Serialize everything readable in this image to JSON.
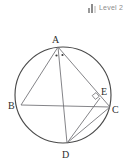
{
  "badge": {
    "label": "Level 2",
    "bars": [
      {
        "name": "bar-1",
        "height": 5,
        "color": "#9a9a9a"
      },
      {
        "name": "bar-2",
        "height": 9,
        "color": "#8c8c8c"
      },
      {
        "name": "bar-3",
        "height": 7,
        "color": "#d8d8d8"
      }
    ]
  },
  "figure": {
    "type": "circle-geometry-diagram",
    "background": "#ffffff",
    "stroke_circle": "#4a4a4a",
    "stroke_chord": "#6e6e72",
    "circle": {
      "cx": 63,
      "cy": 95,
      "r": 48
    },
    "points": {
      "A": {
        "label": "A",
        "x": 58,
        "y": 47,
        "label_x": 52,
        "label_y": 43
      },
      "B": {
        "label": "B",
        "x": 21,
        "y": 105,
        "label_x": 8,
        "label_y": 109
      },
      "C": {
        "label": "C",
        "x": 110,
        "y": 107,
        "label_x": 112,
        "label_y": 113
      },
      "D": {
        "label": "D",
        "x": 67,
        "y": 143,
        "label_x": 62,
        "label_y": 158
      },
      "E": {
        "label": "E",
        "x": 100,
        "y": 98,
        "label_x": 101,
        "label_y": 95
      }
    },
    "chords": [
      {
        "name": "chord-ab",
        "from": "A",
        "to": "B"
      },
      {
        "name": "chord-ad",
        "from": "A",
        "to": "D"
      },
      {
        "name": "chord-ac",
        "from": "A",
        "to": "C"
      },
      {
        "name": "chord-bc",
        "from": "B",
        "to": "C"
      },
      {
        "name": "chord-dc",
        "from": "D",
        "to": "C"
      },
      {
        "name": "chord-de",
        "from": "D",
        "to": "E"
      }
    ],
    "angle_marks": [
      {
        "name": "angle-dot-left",
        "x": 56.5,
        "y": 55.5,
        "r": 1.1
      },
      {
        "name": "angle-dot-right",
        "x": 62.5,
        "y": 55.0,
        "r": 1.1
      }
    ],
    "right_angle": {
      "name": "right-angle-at-e",
      "at": "E",
      "path": "M 92.2 95.6 L 96.0 92.6 L 99.2 96.4 L 95.4 99.4 Z"
    }
  }
}
